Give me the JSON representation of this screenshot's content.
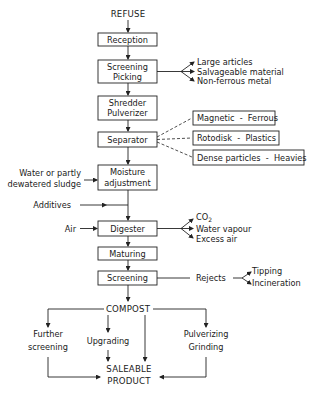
{
  "diagram": {
    "input": "REFUSE",
    "steps": {
      "reception": "Reception",
      "screening_picking": [
        "Screening",
        "Picking"
      ],
      "shredder": [
        "Shredder",
        "Pulverizer"
      ],
      "separator": "Separator",
      "moisture": [
        "Moisture",
        "adjustment"
      ],
      "digester": "Digester",
      "maturing": "Maturing",
      "screening": "Screening"
    },
    "picking_outputs": [
      "Large articles",
      "Salvageable material",
      "Non-ferrous metal"
    ],
    "separator_outputs": [
      "Magnetic  -  Ferrous",
      "Rotodisk  -  Plastics",
      "Dense particles  -  Heavies"
    ],
    "moisture_input": [
      "Water or partly",
      "dewatered sludge"
    ],
    "additives": "Additives",
    "air": "Air",
    "digester_outputs": {
      "co2_prefix": "CO",
      "co2_sub": "2",
      "water": "Water vapour",
      "excess": "Excess air"
    },
    "rejects": "Rejects",
    "rejects_outputs": [
      "Tipping",
      "Incineration"
    ],
    "compost": "COMPOST",
    "further_screening": [
      "Further",
      "screening"
    ],
    "upgrading": "Upgrading",
    "pulverizing": [
      "Pulverizing",
      "Grinding"
    ],
    "product": [
      "SALEABLE",
      "PRODUCT"
    ]
  }
}
